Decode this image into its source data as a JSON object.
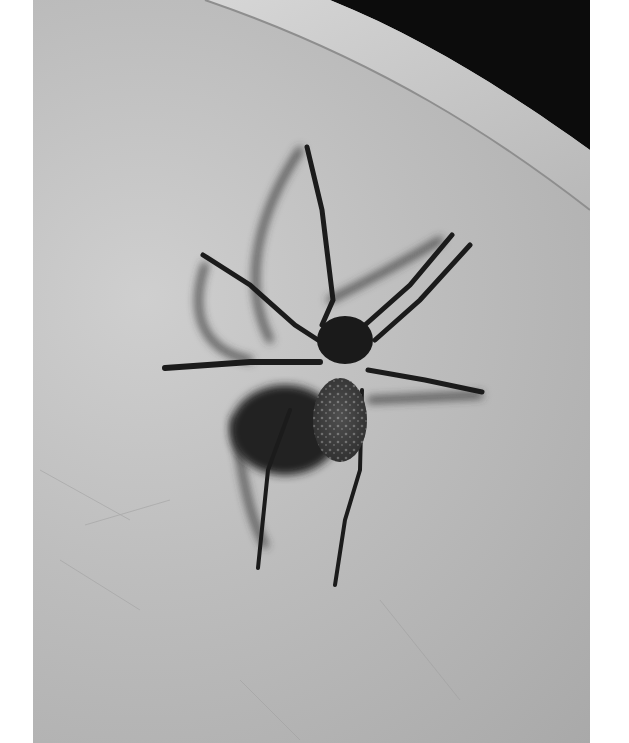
{
  "image": {
    "description": "Black-and-white photograph of a large spider with a speckled abdomen standing on a smooth curved pale surface, casting a strong dark shadow; dark background visible at top right beyond the curved rim.",
    "subject": "spider",
    "colors": {
      "surface": "#bdbdbd",
      "rim": "#c9c9c9",
      "background": "#0c0c0c",
      "spider": "#1a1a1a",
      "shadow": "#2a2a2a",
      "margin": "#ffffff"
    }
  }
}
